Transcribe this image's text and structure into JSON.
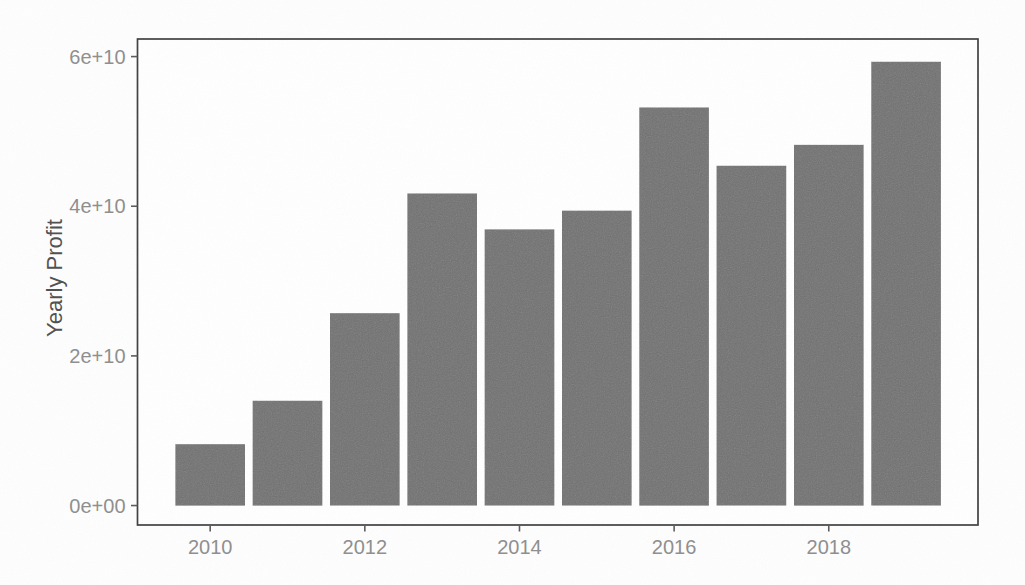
{
  "figure": {
    "kind": "scanned-printed-figure",
    "ylabel": "Yearly Profit"
  },
  "chart_data": {
    "type": "bar",
    "title": "",
    "xlabel": "",
    "ylabel": "Yearly Profit",
    "categories": [
      2010,
      2011,
      2012,
      2013,
      2014,
      2015,
      2016,
      2017,
      2018,
      2019
    ],
    "values": [
      8200000000,
      14000000000,
      25700000000,
      41700000000,
      36900000000,
      39400000000,
      53200000000,
      45400000000,
      48200000000,
      59300000000
    ],
    "x_ticks": [
      {
        "value": 2010,
        "label": "2010"
      },
      {
        "value": 2012,
        "label": "2012"
      },
      {
        "value": 2014,
        "label": "2014"
      },
      {
        "value": 2016,
        "label": "2016"
      },
      {
        "value": 2018,
        "label": "2018"
      }
    ],
    "y_ticks": [
      {
        "value": 0,
        "label": "0e+00"
      },
      {
        "value": 20000000000,
        "label": "2e+10"
      },
      {
        "value": 40000000000,
        "label": "4e+10"
      },
      {
        "value": 60000000000,
        "label": "6e+10"
      }
    ],
    "xlim": [
      2009.06,
      2019.93
    ],
    "ylim": [
      -2600000000,
      62350000000
    ],
    "bar_width_x_units": 0.9,
    "grid": false,
    "legend_position": "none",
    "colors": {
      "bar_fill": "#6f6f6f",
      "panel_border": "#3f3f3f",
      "tick_mark": "#5a5a5a",
      "tick_label": "#8e8e8e",
      "axis_title": "#4f4f4f",
      "panel_background": "#ffffff",
      "page_background": "#fefefe"
    }
  }
}
